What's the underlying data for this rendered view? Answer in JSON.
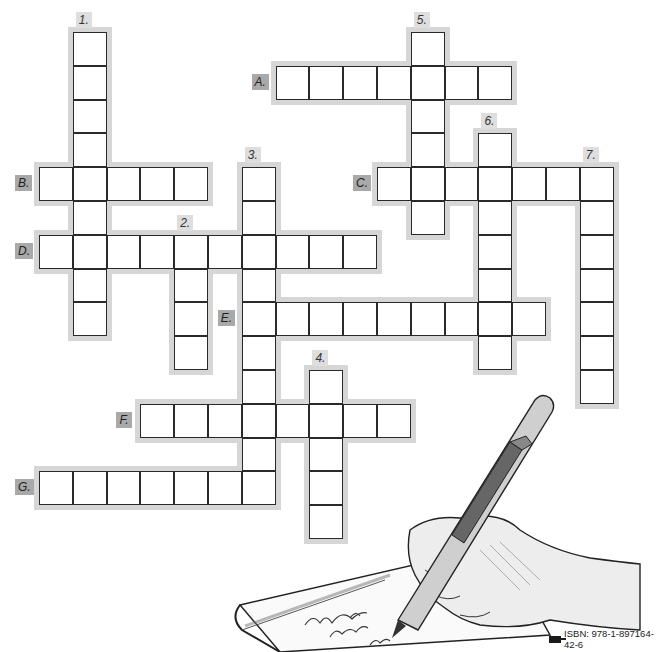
{
  "puzzle": {
    "type": "crossword",
    "cell_size_px": 33.8,
    "origin_px": {
      "x": 39,
      "y": 32
    },
    "colors": {
      "cell_border": "#2a2a2a",
      "halo": "#d6d6d6",
      "down_label_bg": "#dedede",
      "across_label_bg": "#a9a9a9"
    },
    "down": [
      {
        "label": "1.",
        "col": 1,
        "row": 0,
        "length": 9
      },
      {
        "label": "2.",
        "col": 4,
        "row": 6,
        "length": 4
      },
      {
        "label": "3.",
        "col": 6,
        "row": 4,
        "length": 10
      },
      {
        "label": "4.",
        "col": 8,
        "row": 10,
        "length": 5
      },
      {
        "label": "5.",
        "col": 11,
        "row": 0,
        "length": 6
      },
      {
        "label": "6.",
        "col": 13,
        "row": 3,
        "length": 7
      },
      {
        "label": "7.",
        "col": 16,
        "row": 4,
        "length": 7
      }
    ],
    "across": [
      {
        "label": "A.",
        "col": 7,
        "row": 1,
        "length": 7
      },
      {
        "label": "B.",
        "col": 0,
        "row": 4,
        "length": 5
      },
      {
        "label": "C.",
        "col": 10,
        "row": 4,
        "length": 7
      },
      {
        "label": "D.",
        "col": 0,
        "row": 6,
        "length": 10
      },
      {
        "label": "E.",
        "col": 6,
        "row": 8,
        "length": 9
      },
      {
        "label": "F.",
        "col": 3,
        "row": 11,
        "length": 8
      },
      {
        "label": "G.",
        "col": 0,
        "row": 13,
        "length": 7
      }
    ]
  },
  "illustration": {
    "subject": "hand-writing-with-pen-on-notepad",
    "notepad_scribble": "Un Jean ... The Onion ..."
  },
  "footer": {
    "isbn": "ISBN: 978-1-897164-42-6",
    "publisher_logo": "publisher-logo-icon"
  }
}
